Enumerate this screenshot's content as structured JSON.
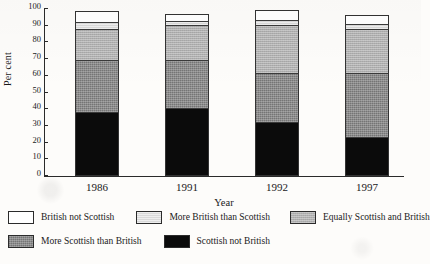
{
  "chart_data": {
    "type": "bar",
    "subtype": "stacked-bar-100",
    "title": "",
    "xlabel": "Year",
    "ylabel": "Per cent",
    "ylim": [
      0,
      100
    ],
    "yticks": [
      0,
      10,
      20,
      30,
      40,
      50,
      60,
      70,
      80,
      90,
      100
    ],
    "grid": false,
    "legend_position": "bottom",
    "categories": [
      "1986",
      "1991",
      "1992",
      "1997"
    ],
    "stack_order_bottom_to_top": [
      "Scottish not British",
      "More Scottish than British",
      "Equally Scottish and British",
      "More British than Scottish",
      "British not Scottish"
    ],
    "series": [
      {
        "name": "Scottish not British",
        "fill": "black",
        "values": [
          38.5,
          41.0,
          32.5,
          23.5
        ]
      },
      {
        "name": "More Scottish than British",
        "fill": "darkgray",
        "values": [
          31.0,
          28.5,
          29.0,
          38.0
        ]
      },
      {
        "name": "Equally Scottish and British",
        "fill": "midgray",
        "values": [
          18.5,
          21.0,
          29.0,
          26.5
        ]
      },
      {
        "name": "More British than Scottish",
        "fill": "lightgray",
        "values": [
          4.0,
          2.5,
          3.0,
          3.0
        ]
      },
      {
        "name": "British not Scottish",
        "fill": "white",
        "values": [
          7.0,
          4.0,
          6.0,
          5.5
        ]
      }
    ],
    "cumulative_tops": {
      "1986": [
        38.5,
        69.5,
        88.0,
        92.0,
        99.0
      ],
      "1991": [
        41.0,
        69.5,
        90.5,
        93.0,
        97.0
      ],
      "1992": [
        32.5,
        61.5,
        90.5,
        93.5,
        99.5
      ],
      "1997": [
        23.5,
        61.5,
        88.0,
        91.0,
        96.5
      ]
    }
  },
  "axes": {
    "y_title": "Per cent",
    "x_title": "Year",
    "y_tick_labels": [
      "100",
      "90",
      "80",
      "70",
      "60",
      "50",
      "40",
      "30",
      "20",
      "10",
      "0"
    ],
    "x_tick_labels": [
      "1986",
      "1991",
      "1992",
      "1997"
    ]
  },
  "legend": {
    "row1": [
      {
        "label": "British not Scottish",
        "fill": "white"
      },
      {
        "label": "More British than Scottish",
        "fill": "lightgray"
      },
      {
        "label": "Equally Scottish and British",
        "fill": "midgray"
      }
    ],
    "row2": [
      {
        "label": "More Scottish than British",
        "fill": "darkgray"
      },
      {
        "label": "Scottish not British",
        "fill": "black"
      }
    ]
  },
  "colors": {
    "white": "#ffffff",
    "lightgray": "#d9d9d9",
    "midgray": "#b0b0b0",
    "darkgray": "#8b8b8b",
    "black": "#0b0b0b",
    "axis": "#2a2a2a",
    "background": "#fdfcfa"
  }
}
